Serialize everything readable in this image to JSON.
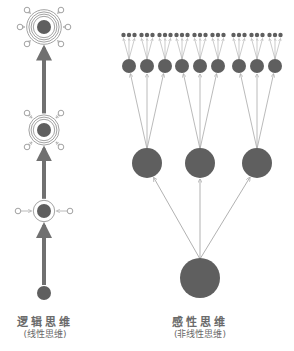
{
  "colors": {
    "node_fill": "#5f5f5f",
    "stem": "#707070",
    "line": "#a8a8a8",
    "ring": "#8a8a8a",
    "text": "#6a6a6a",
    "background": "#ffffff"
  },
  "left_diagram": {
    "title": "逻辑思维",
    "subtitle": "(线性思维)",
    "stem_x": 44,
    "nodes": [
      {
        "y": 27,
        "r": 7,
        "rings": 4,
        "inputs": 6
      },
      {
        "y": 130,
        "r": 7,
        "rings": 3,
        "inputs": 4
      },
      {
        "y": 211,
        "r": 7,
        "rings": 1,
        "inputs": 2
      },
      {
        "y": 293,
        "r": 7,
        "rings": 0,
        "inputs": 0
      }
    ]
  },
  "right_diagram": {
    "title": "感性思维",
    "subtitle": "(非线性思维)",
    "root": {
      "x": 200,
      "y": 278,
      "r": 20
    },
    "mid": [
      {
        "x": 147,
        "y": 163,
        "r": 15
      },
      {
        "x": 200,
        "y": 163,
        "r": 15
      },
      {
        "x": 257,
        "y": 163,
        "r": 15
      }
    ],
    "small_nodes_per_mid": 3,
    "small_r": 7,
    "tiny_nodes_per_small": 3,
    "tiny_r": 2.2
  }
}
